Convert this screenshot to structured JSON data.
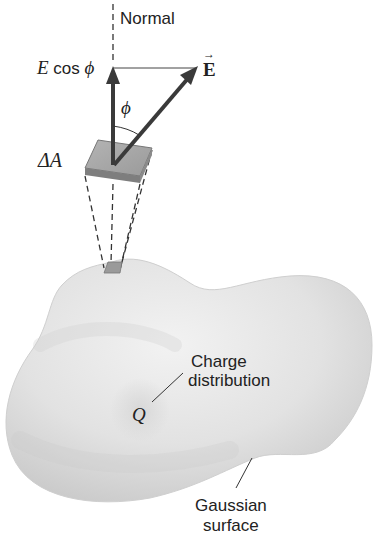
{
  "diagram": {
    "labels": {
      "normal": "Normal",
      "e_cos_phi_E": "E",
      "e_cos_phi_cos": " cos ",
      "e_cos_phi_phi": "ϕ",
      "field_vector": "E",
      "field_vector_arrow": "→",
      "angle": "ϕ",
      "area_element": "ΔA",
      "charge": "Q",
      "charge_distribution_line1": "Charge",
      "charge_distribution_line2": "distribution",
      "gaussian_surface_line1": "Gaussian",
      "gaussian_surface_line2": "surface"
    },
    "colors": {
      "surface_light": "#eeeeee",
      "surface_mid": "#d9d9d9",
      "surface_shadow": "#c4c4c4",
      "patch_top": "#a8a8a8",
      "patch_edge": "#7a7a7a",
      "arrow": "#3a3a3a",
      "text": "#222222"
    }
  }
}
